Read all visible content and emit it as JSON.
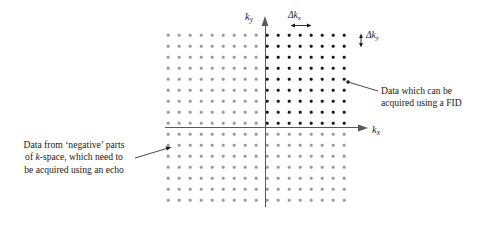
{
  "figure": {
    "background_color": "#ffffff",
    "width": 485,
    "height": 228
  },
  "axes": {
    "x_label_text": "k",
    "x_label_sub": "x",
    "y_label_text": "k",
    "y_label_sub": "y",
    "axis_color": "#5a5a5a",
    "origin_x": 265,
    "origin_y": 128
  },
  "spacing_labels": {
    "delta_kx": {
      "symbol": "Δk",
      "sub": "x"
    },
    "delta_ky": {
      "symbol": "Δk",
      "sub": "y"
    }
  },
  "annotations": {
    "right": {
      "name": "fid-annotation",
      "lines": [
        "Data which can be",
        "acquired using a FID"
      ]
    },
    "left": {
      "name": "echo-annotation",
      "lines": [
        "Data from ‘negative’ parts",
        "of k-space, which need to",
        "be acquired using an echo"
      ],
      "italic_token": "k"
    }
  },
  "chart_data": {
    "type": "scatter",
    "xlabel": "kx",
    "ylabel": "ky",
    "grid": true,
    "legend": "none",
    "lattice": {
      "columns": 17,
      "rows": 16,
      "x_start_px": 168,
      "y_start_px": 35,
      "dx_px": 11.0,
      "dy_px": 11.0,
      "origin_col_index": 9,
      "origin_row_index": 8,
      "dot_radius_px": 1.3
    },
    "series": [
      {
        "name": "FID-acquirable points (dark)",
        "color": "#151515",
        "kx_indices": [
          0,
          1,
          2,
          3,
          4,
          5,
          6,
          7
        ],
        "ky_indices": [
          0,
          1,
          2,
          3,
          4,
          5,
          6,
          7,
          8
        ],
        "count": 72
      },
      {
        "name": "Echo-required points (light)",
        "color": "#9a9a9a",
        "kx_indices": [
          -9,
          -8,
          -7,
          -6,
          -5,
          -4,
          -3,
          -2,
          -1,
          0,
          1,
          2,
          3,
          4,
          5,
          6,
          7
        ],
        "ky_indices": [
          -7,
          -6,
          -5,
          -4,
          -3,
          -2,
          -1,
          0,
          1,
          2,
          3,
          4,
          5,
          6,
          7,
          8
        ],
        "count": 200
      }
    ],
    "xlim": [
      -9,
      7
    ],
    "ylim": [
      -7,
      8
    ],
    "annotations": [
      {
        "text": "Δkx",
        "role": "horizontal sample spacing marker",
        "position": "above grid, right of ky axis"
      },
      {
        "text": "Δky",
        "role": "vertical sample spacing marker",
        "position": "right edge of grid, top row"
      },
      {
        "text": "Data which can be acquired using a FID",
        "role": "callout to dark upper-right quadrant"
      },
      {
        "text": "Data from ‘negative’ parts of k-space, which need to be acquired using an echo",
        "role": "callout to light left/lower region"
      }
    ]
  }
}
